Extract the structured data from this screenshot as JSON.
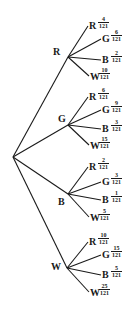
{
  "diagram": {
    "type": "probability-tree",
    "root": {
      "x": 13,
      "y": 157
    },
    "line_color": "#1a1a1a",
    "branches": [
      {
        "label": "R",
        "node": {
          "x": 68,
          "y": 57
        },
        "label_pos": {
          "x": 53,
          "y": 47
        },
        "leaves": [
          {
            "label": "R",
            "num": "4",
            "den": "121",
            "end": {
              "x": 88,
              "y": 26
            },
            "y": 21
          },
          {
            "label": "G",
            "num": "6",
            "den": "121",
            "end": {
              "x": 101,
              "y": 39
            },
            "y": 34
          },
          {
            "label": "B",
            "num": "2",
            "den": "121",
            "end": {
              "x": 101,
              "y": 60
            },
            "y": 55
          },
          {
            "label": "W",
            "num": "10",
            "den": "121",
            "end": {
              "x": 89,
              "y": 76
            },
            "y": 72
          }
        ]
      },
      {
        "label": "G",
        "node": {
          "x": 68,
          "y": 125
        },
        "label_pos": {
          "x": 58,
          "y": 114
        },
        "leaves": [
          {
            "label": "R",
            "num": "6",
            "den": "121",
            "end": {
              "x": 88,
              "y": 97
            },
            "y": 92
          },
          {
            "label": "G",
            "num": "9",
            "den": "121",
            "end": {
              "x": 101,
              "y": 110
            },
            "y": 105
          },
          {
            "label": "B",
            "num": "3",
            "den": "121",
            "end": {
              "x": 101,
              "y": 129
            },
            "y": 124
          },
          {
            "label": "W",
            "num": "15",
            "den": "121",
            "end": {
              "x": 89,
              "y": 145
            },
            "y": 141
          }
        ]
      },
      {
        "label": "B",
        "node": {
          "x": 68,
          "y": 194
        },
        "label_pos": {
          "x": 58,
          "y": 197
        },
        "leaves": [
          {
            "label": "R",
            "num": "2",
            "den": "121",
            "end": {
              "x": 88,
              "y": 167
            },
            "y": 162
          },
          {
            "label": "G",
            "num": "3",
            "den": "121",
            "end": {
              "x": 101,
              "y": 182
            },
            "y": 177
          },
          {
            "label": "B",
            "num": "1",
            "den": "121",
            "end": {
              "x": 101,
              "y": 200
            },
            "y": 195
          },
          {
            "label": "W",
            "num": "5",
            "den": "121",
            "end": {
              "x": 89,
              "y": 217
            },
            "y": 213
          }
        ]
      },
      {
        "label": "W",
        "node": {
          "x": 67,
          "y": 268
        },
        "label_pos": {
          "x": 51,
          "y": 262
        },
        "leaves": [
          {
            "label": "R",
            "num": "10",
            "den": "121",
            "end": {
              "x": 88,
              "y": 242
            },
            "y": 237
          },
          {
            "label": "G",
            "num": "15",
            "den": "121",
            "end": {
              "x": 101,
              "y": 255
            },
            "y": 250
          },
          {
            "label": "B",
            "num": "5",
            "den": "121",
            "end": {
              "x": 101,
              "y": 275
            },
            "y": 270
          },
          {
            "label": "W",
            "num": "25",
            "den": "121",
            "end": {
              "x": 89,
              "y": 292
            },
            "y": 288
          }
        ]
      }
    ]
  }
}
